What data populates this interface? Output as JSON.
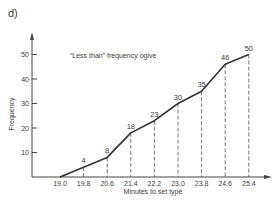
{
  "figure": {
    "panel_label": "d)"
  },
  "chart_data": {
    "type": "line",
    "title": "“Less than” frequency ogive",
    "xlabel": "Minutes to set type",
    "ylabel": "Frequency",
    "x_ticks": [
      "19.0",
      "19.8",
      "20.6",
      "21.4",
      "22.2",
      "23.0",
      "23.8",
      "24.6",
      "25.4"
    ],
    "y_ticks": [
      "10",
      "20",
      "30",
      "40",
      "50"
    ],
    "ylim": [
      0,
      55
    ],
    "grid": false,
    "legend": null,
    "series": [
      {
        "name": "Cumulative frequency (less than)",
        "x": [
          19.0,
          19.8,
          20.6,
          21.4,
          22.2,
          23.0,
          23.8,
          24.6,
          25.4
        ],
        "values": [
          0,
          4,
          8,
          18,
          23,
          30,
          35,
          46,
          50
        ],
        "point_labels": [
          "",
          "4",
          "8",
          "18",
          "23",
          "30",
          "35",
          "46",
          "50"
        ]
      }
    ],
    "annotations": "Dashed vertical drop lines from each labeled point to the x-axis"
  },
  "layout": {
    "line_color": "#333333",
    "axis_color": "#444444",
    "dash_color": "#555555"
  }
}
